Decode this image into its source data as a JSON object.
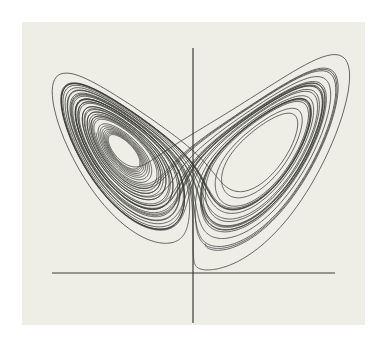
{
  "figure": {
    "background_color": "#eeeee6",
    "line_color": "#3a3a3a",
    "axis_color": "#3c3c3c"
  },
  "chart_data": {
    "type": "line",
    "title": "",
    "xlabel": "",
    "ylabel": "",
    "series": [
      {
        "name": "Lorenz trajectory",
        "system": {
          "sigma": 10,
          "rho": 28,
          "beta": 2.6667
        },
        "initial_state": [
          1.5,
          1.2,
          8.0
        ],
        "dt": 0.005,
        "steps": 9000
      }
    ],
    "axes": {
      "horizontal": {
        "x1": 52,
        "x2": 335,
        "y": 273
      },
      "vertical": {
        "x": 193,
        "y1": 48,
        "y2": 323
      }
    },
    "grid": false,
    "legend": null
  }
}
